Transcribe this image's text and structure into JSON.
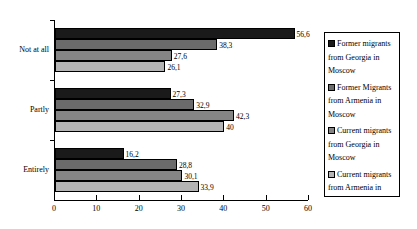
{
  "chart_data": {
    "type": "bar",
    "orientation": "horizontal",
    "title": "",
    "xlabel": "",
    "ylabel": "",
    "categories": [
      "Not at all",
      "Partly",
      "Entirely"
    ],
    "series": [
      {
        "name": "Former migrants from Georgia in Moscow",
        "color": "#1a1a1a",
        "values": [
          56.6,
          27.3,
          16.2
        ],
        "labels": [
          "56,6",
          "27,3",
          "16,2"
        ]
      },
      {
        "name": "Former Migrants from Armenia in Moscow",
        "color": "#6b6b6b",
        "values": [
          38.3,
          32.9,
          28.8
        ],
        "labels": [
          "38,3",
          "32,9",
          "28,8"
        ]
      },
      {
        "name": "Current migrants from Georgia in Moscow",
        "color": "#858585",
        "values": [
          27.6,
          42.3,
          30.1
        ],
        "labels": [
          "27,6",
          "42,3",
          "30,1"
        ]
      },
      {
        "name": "Current migrants from Armenia in Moscow",
        "color": "#b4b4b4",
        "values": [
          26.1,
          40.0,
          33.9
        ],
        "labels": [
          "26,1",
          "40",
          "33,9"
        ]
      }
    ],
    "xlim": [
      0,
      60
    ],
    "xticks": [
      0,
      10,
      20,
      30,
      40,
      50,
      60
    ],
    "xtick_labels": [
      "0",
      "10",
      "20",
      "30",
      "40",
      "50",
      "60"
    ],
    "grid": false,
    "legend_position": "right-inside"
  },
  "legend": {
    "entries": [
      {
        "label": "Former migrants from Georgia in Moscow",
        "color": "#1a1a1a"
      },
      {
        "label": "Former Migrants from Armenia in Moscow",
        "color": "#6b6b6b"
      },
      {
        "label": "Current migrants from Georgia in Moscow",
        "color": "#858585"
      },
      {
        "label": "Current migrants from Armenia in Moscow",
        "color": "#b4b4b4"
      }
    ]
  }
}
